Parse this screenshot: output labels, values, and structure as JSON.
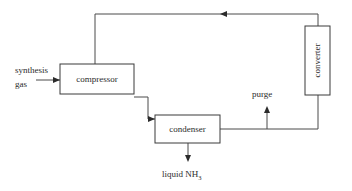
{
  "diagram": {
    "background_color": "#ffffff",
    "line_color": "#4a4a4a",
    "text_color": "#2b2b2b",
    "units": [
      {
        "id": "compressor",
        "label": "compressor",
        "orientation": "horizontal"
      },
      {
        "id": "condenser",
        "label": "condenser",
        "orientation": "horizontal"
      },
      {
        "id": "converter",
        "label": "converter",
        "orientation": "vertical"
      }
    ],
    "streams": [
      {
        "id": "feed",
        "label_line1": "synthesis",
        "label_line2": "gas",
        "arrow": "right"
      },
      {
        "id": "purge",
        "label": "purge",
        "arrow": "up"
      },
      {
        "id": "product",
        "label_text": "liquid NH",
        "label_subscript": "3",
        "arrow": "down"
      },
      {
        "id": "recycle",
        "label": "",
        "arrow": "left"
      }
    ]
  }
}
